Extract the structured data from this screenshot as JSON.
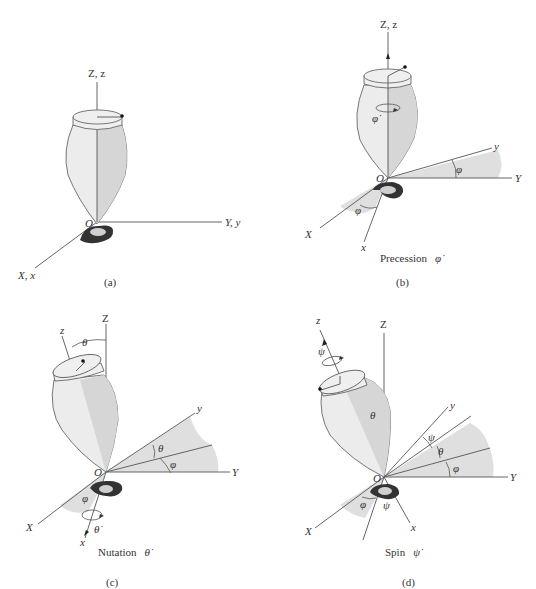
{
  "figure": {
    "panels": [
      {
        "id": "a",
        "caption": "(a)",
        "motion_label": "",
        "axis_labels": {
          "vertical": "Z, z",
          "horizontal": "Y, y",
          "oblique": "X, x",
          "origin": "O"
        }
      },
      {
        "id": "b",
        "caption": "(b)",
        "motion_label": "Precession",
        "rate_symbol": "φ̇",
        "axis_labels": {
          "vertical": "Z, z",
          "Y": "Y",
          "y": "y",
          "X": "X",
          "x": "x",
          "origin": "O"
        },
        "angle_labels": [
          "φ",
          "φ",
          "φ̇"
        ]
      },
      {
        "id": "c",
        "caption": "(c)",
        "motion_label": "Nutation",
        "rate_symbol": "θ̇",
        "axis_labels": {
          "Z": "Z",
          "z": "z",
          "Y": "Y",
          "y": "y",
          "X": "X",
          "x": "x",
          "origin": "O"
        },
        "angle_labels": [
          "θ",
          "θ",
          "φ",
          "φ",
          "θ̇"
        ]
      },
      {
        "id": "d",
        "caption": "(d)",
        "motion_label": "Spin",
        "rate_symbol": "ψ̇",
        "axis_labels": {
          "Z": "Z",
          "z": "z",
          "Y": "Y",
          "y": "y",
          "X": "X",
          "x": "x",
          "origin": "O"
        },
        "angle_labels": [
          "ψ",
          "θ",
          "ψ",
          "θ",
          "φ",
          "φ",
          "ψ"
        ]
      }
    ]
  }
}
